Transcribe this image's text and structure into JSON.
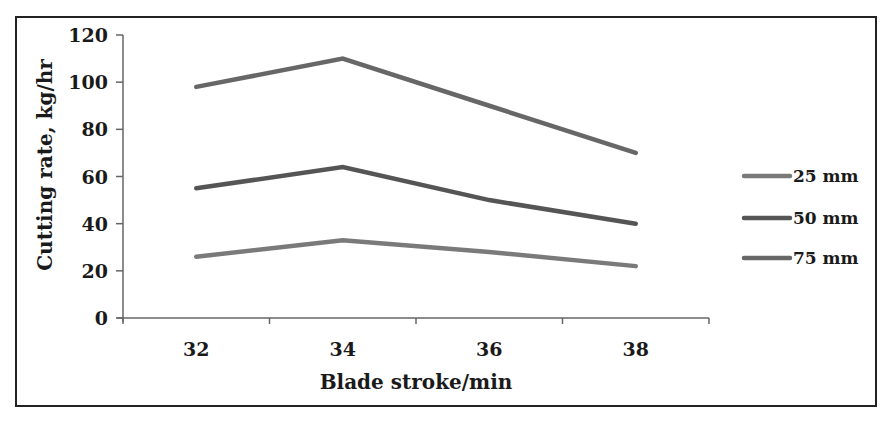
{
  "chart_data": {
    "type": "line",
    "title": "",
    "xlabel": "Blade stroke/min",
    "ylabel": "Cutting rate, kg/hr",
    "categories": [
      "32",
      "34",
      "36",
      "38"
    ],
    "yticks": [
      0,
      20,
      40,
      60,
      80,
      100,
      120
    ],
    "ylim": [
      0,
      120
    ],
    "grid": false,
    "legend_position": "right",
    "series": [
      {
        "name": "25 mm",
        "values": [
          26,
          33,
          28,
          22
        ],
        "color": "#7a7a7a"
      },
      {
        "name": "50 mm",
        "values": [
          55,
          64,
          50,
          40
        ],
        "color": "#555555"
      },
      {
        "name": "75 mm",
        "values": [
          98,
          110,
          90,
          70
        ],
        "color": "#676767"
      }
    ]
  }
}
